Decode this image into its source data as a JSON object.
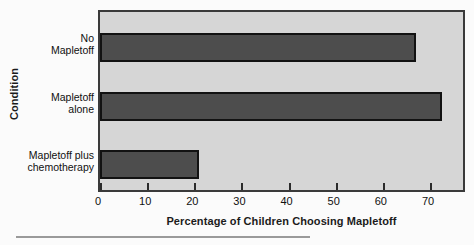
{
  "chart_data": {
    "type": "bar",
    "orientation": "horizontal",
    "title": "",
    "xlabel": "Percentage of Children Choosing Mapletoff",
    "ylabel": "Condition",
    "categories": [
      "No Mapletoff",
      "Mapletoff alone",
      "Mapletoff plus chemotherapy"
    ],
    "category_lines": [
      [
        "No",
        "Mapletoff"
      ],
      [
        "Mapletoff",
        "alone"
      ],
      [
        "Mapletoff plus",
        "chemotherapy"
      ]
    ],
    "values": [
      67,
      72.5,
      21
    ],
    "xlim": [
      0,
      77
    ],
    "xticks": [
      0,
      10,
      20,
      30,
      40,
      50,
      60,
      70
    ],
    "xtick_labels": [
      "0",
      "10",
      "20",
      "30",
      "40",
      "50",
      "60",
      "70"
    ],
    "grid": false,
    "legend": false,
    "colors": {
      "bar_fill": "#4d4d4d",
      "bar_edge": "#121212",
      "plot_background": "#d6d6d6",
      "frame": "#3a3a3a",
      "text": "#101010",
      "rule": "#9a9a9a"
    }
  }
}
